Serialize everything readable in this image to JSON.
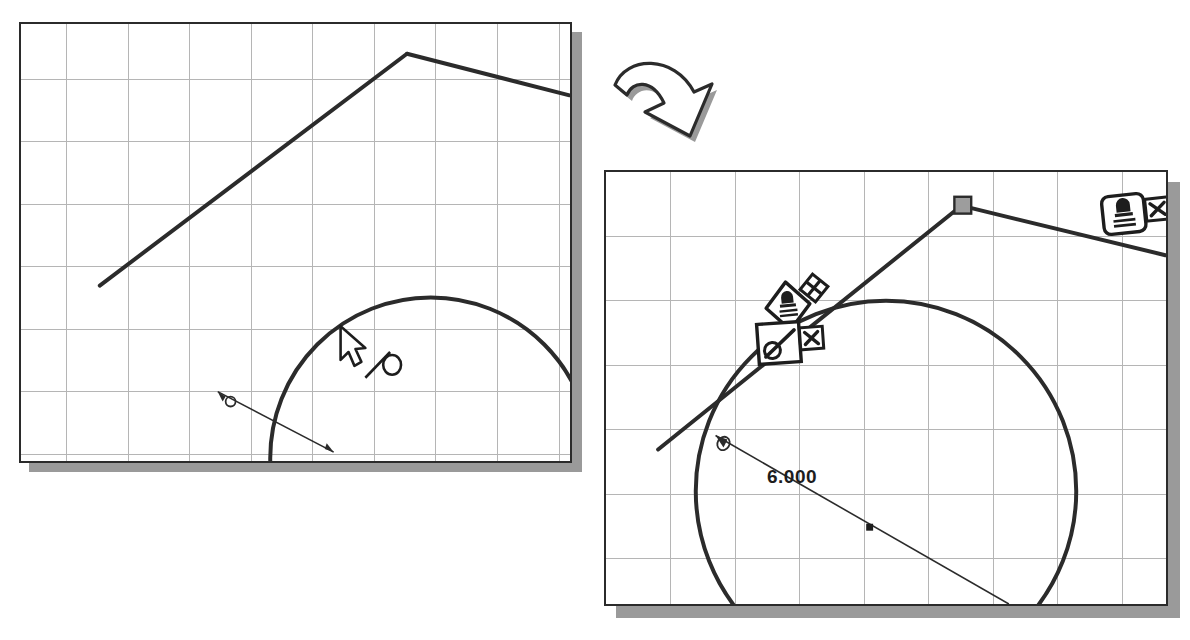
{
  "figure": {
    "type": "cad-sketch-comparison",
    "background_color": "#ffffff",
    "line_color": "#2b2b2b",
    "grid_color": "#b4b4b4",
    "shadow_color": "#9a9a9a",
    "vertex_handle_color": "#9d9d9d"
  },
  "flow_arrow": {
    "name": "curved-down-right-arrow",
    "direction": "down-right"
  },
  "panel_before": {
    "title": "",
    "grid": {
      "columns": 9,
      "rows": 7,
      "cell_px": 62,
      "visible": true
    },
    "cursor": {
      "name": "arrow-cursor",
      "x": 341,
      "y": 327
    },
    "relation_hint": {
      "name": "tangent-relation-glyph",
      "label": "tangent",
      "x": 371,
      "y": 360
    },
    "dimension": {
      "value": "6.000",
      "clipped": true
    },
    "entities": [
      {
        "name": "polyline-segment-1",
        "type": "line"
      },
      {
        "name": "polyline-segment-2",
        "type": "line"
      },
      {
        "name": "circle-arc",
        "type": "arc"
      },
      {
        "name": "diameter-dimension",
        "type": "dimension"
      }
    ]
  },
  "panel_after": {
    "title": "",
    "grid": {
      "columns": 8,
      "rows": 6,
      "cell_px": 65,
      "visible": true
    },
    "dimension": {
      "value": "6.000"
    },
    "entities": [
      {
        "name": "polyline-segment-1",
        "type": "line"
      },
      {
        "name": "polyline-segment-2",
        "type": "line"
      },
      {
        "name": "circle",
        "type": "circle"
      },
      {
        "name": "diameter-dimension",
        "type": "dimension"
      },
      {
        "name": "vertex-handle",
        "type": "point",
        "x": 962,
        "y": 203
      }
    ],
    "relation_badges": [
      {
        "name": "fix-relation-badge-top-right",
        "relation": "Fix",
        "icon": "anchor-fix-icon",
        "shape": "rounded-square",
        "x": 1104,
        "y": 192,
        "delete_marker": {
          "name": "delete-x-marker",
          "symbol": "X",
          "x": 1138,
          "y": 198
        }
      },
      {
        "name": "fix-relation-badge-center",
        "relation": "Fix",
        "icon": "anchor-fix-icon",
        "shape": "diamond",
        "x": 770,
        "y": 286,
        "delete_marker": {
          "name": "delete-x-marker",
          "symbol": "X",
          "x": 798,
          "y": 269
        }
      },
      {
        "name": "tangent-relation-badge",
        "relation": "Tangent",
        "icon": "tangent-relation-icon",
        "shape": "square",
        "x": 762,
        "y": 325,
        "delete_marker": {
          "name": "delete-x-marker",
          "symbol": "X",
          "x": 797,
          "y": 333
        }
      }
    ]
  }
}
